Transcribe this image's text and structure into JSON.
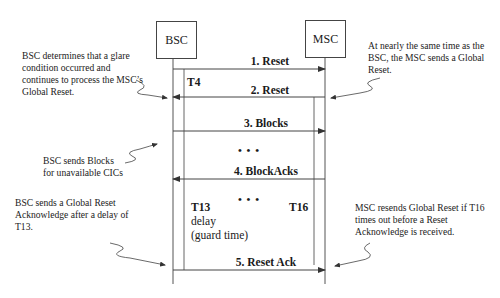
{
  "diagram": {
    "type": "sequence",
    "entities": [
      {
        "id": "bsc",
        "label": "BSC"
      },
      {
        "id": "msc",
        "label": "MSC"
      }
    ],
    "messages": [
      {
        "label": "1. Reset",
        "from": "BSC",
        "to": "MSC"
      },
      {
        "label": "2. Reset",
        "from": "MSC",
        "to": "BSC"
      },
      {
        "label": "3. Blocks",
        "from": "BSC",
        "to": "MSC"
      },
      {
        "label": "4. BlockAcks",
        "from": "MSC",
        "to": "BSC"
      },
      {
        "label": "5. Reset Ack",
        "from": "BSC",
        "to": "MSC"
      }
    ],
    "ellipses": [
      "• • •",
      "• • •"
    ],
    "timers": {
      "t4": "T4",
      "t13": "T13",
      "t13_delay": "delay",
      "t13_guard": "(guard time)",
      "t16": "T16"
    },
    "notes": {
      "glare": [
        "BSC determines that a glare",
        "condition occurred and",
        "continues to process the MSC’s",
        "Global Reset."
      ],
      "msc_reset": [
        "At nearly the same time as the",
        "BSC, the MSC sends a Global",
        "Reset."
      ],
      "blocks": [
        "BSC sends Blocks",
        "for unavailable CICs"
      ],
      "reset_ack": [
        "BSC sends a Global Reset",
        "Acknowledge after a delay of",
        "T13."
      ],
      "resend": [
        "MSC resends Global Reset if T16",
        "times out before a  Reset",
        "Acknowledge is received."
      ]
    },
    "colors": {
      "line": "#444444",
      "text": "#1a1a1a",
      "background": "#ffffff"
    }
  }
}
